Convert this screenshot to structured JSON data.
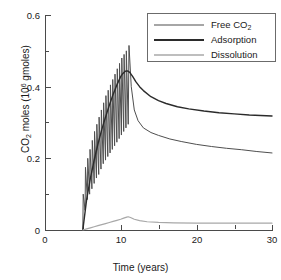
{
  "chart_data": {
    "type": "line",
    "title": "",
    "xlabel": "Time (years)",
    "ylabel": "CO2 moles (10^6 gmoles)",
    "ylabel_parts": {
      "pre": "CO",
      "sub": "2",
      "mid": " moles (10",
      "sup": "6",
      "post": " gmoles)"
    },
    "xlim": [
      0,
      30
    ],
    "ylim": [
      0,
      0.6
    ],
    "xticks": [
      0,
      10,
      20,
      30
    ],
    "xtick_labels": [
      "0",
      "10",
      "20",
      "30"
    ],
    "xminor_ticks": [
      5,
      15,
      25
    ],
    "yticks": [
      0,
      0.2,
      0.4,
      0.6
    ],
    "ytick_labels": [
      "0",
      "0.2",
      "0.4",
      "0.6"
    ],
    "yminor_ticks": [
      0.1,
      0.3,
      0.5
    ],
    "grid": false,
    "legend_position": "top-right",
    "series": [
      {
        "name": "Free CO2",
        "name_parts": {
          "pre": "Free CO",
          "sub": "2"
        },
        "color": "#4f4f4f",
        "width": 1.0,
        "x": [
          5.0,
          5.05,
          5.3,
          5.35,
          5.6,
          5.65,
          5.9,
          5.95,
          6.2,
          6.25,
          6.5,
          6.55,
          6.8,
          6.85,
          7.1,
          7.15,
          7.4,
          7.45,
          7.7,
          7.75,
          8.0,
          8.05,
          8.3,
          8.35,
          8.6,
          8.65,
          8.9,
          8.95,
          9.2,
          9.25,
          9.5,
          9.55,
          9.8,
          9.85,
          10.1,
          10.15,
          10.4,
          10.45,
          10.7,
          10.75,
          11.0,
          11.1,
          11.4,
          11.8,
          12.3,
          13.0,
          14.0,
          15.0,
          16.5,
          18.0,
          20.0,
          22.0,
          24.0,
          26.0,
          28.0,
          30.0
        ],
        "y": [
          0.0,
          0.1,
          0.055,
          0.175,
          0.085,
          0.2,
          0.1,
          0.225,
          0.115,
          0.25,
          0.13,
          0.275,
          0.145,
          0.295,
          0.155,
          0.315,
          0.17,
          0.335,
          0.185,
          0.355,
          0.195,
          0.375,
          0.205,
          0.39,
          0.215,
          0.405,
          0.225,
          0.42,
          0.235,
          0.435,
          0.245,
          0.45,
          0.255,
          0.465,
          0.265,
          0.48,
          0.275,
          0.49,
          0.285,
          0.5,
          0.295,
          0.515,
          0.4,
          0.335,
          0.305,
          0.285,
          0.272,
          0.264,
          0.254,
          0.247,
          0.239,
          0.233,
          0.228,
          0.224,
          0.219,
          0.215
        ]
      },
      {
        "name": "Adsorption",
        "color": "#2b2b2b",
        "width": 1.4,
        "x": [
          5.0,
          5.5,
          6.0,
          6.5,
          7.0,
          7.5,
          8.0,
          8.5,
          9.0,
          9.5,
          10.0,
          10.3,
          10.6,
          10.9,
          11.2,
          11.6,
          12.0,
          12.5,
          13.0,
          14.0,
          15.0,
          16.0,
          17.5,
          19.0,
          21.0,
          23.0,
          25.0,
          27.0,
          30.0
        ],
        "y": [
          0.0,
          0.085,
          0.145,
          0.195,
          0.24,
          0.28,
          0.315,
          0.348,
          0.378,
          0.405,
          0.428,
          0.437,
          0.443,
          0.444,
          0.44,
          0.428,
          0.414,
          0.4,
          0.389,
          0.372,
          0.361,
          0.353,
          0.344,
          0.338,
          0.332,
          0.327,
          0.324,
          0.321,
          0.318
        ]
      },
      {
        "name": "Dissolution",
        "color": "#a8a8a8",
        "width": 1.2,
        "x": [
          5.0,
          5.5,
          6.0,
          6.5,
          7.0,
          7.5,
          8.0,
          8.5,
          9.0,
          9.5,
          10.0,
          10.4,
          10.8,
          11.0,
          11.3,
          11.8,
          12.5,
          13.5,
          15.0,
          17.0,
          20.0,
          24.0,
          27.0,
          30.0
        ],
        "y": [
          0.0,
          0.003,
          0.006,
          0.009,
          0.012,
          0.015,
          0.018,
          0.021,
          0.024,
          0.027,
          0.03,
          0.033,
          0.036,
          0.037,
          0.035,
          0.03,
          0.026,
          0.023,
          0.021,
          0.02,
          0.019,
          0.019,
          0.019,
          0.019
        ]
      }
    ]
  },
  "legend": {
    "entries": [
      {
        "label": "Free CO2"
      },
      {
        "label": "Adsorption"
      },
      {
        "label": "Dissolution"
      }
    ]
  },
  "axes": {
    "x_title": "Time (years)",
    "y_title": "CO2 moles (10^6 gmoles)"
  },
  "caption": {
    "text": ""
  }
}
